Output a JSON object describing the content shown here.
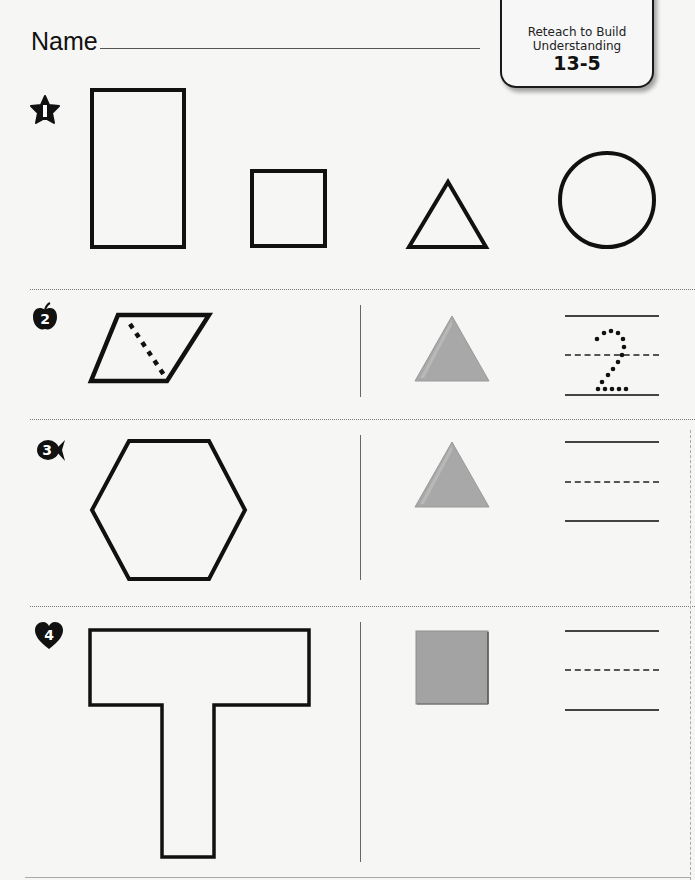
{
  "header": {
    "name_label": "Name",
    "lesson_box": {
      "subtitle_line1": "Reteach to Build",
      "subtitle_line2": "Understanding",
      "lesson_number": "13-5"
    }
  },
  "colors": {
    "page_background": "#f6f6f5",
    "outline": "#111111",
    "pattern_block_fill": "#a8a8a8",
    "lesson_box_border": "#1a1a1a"
  },
  "problems": [
    {
      "number": "1",
      "badge_icon": "star-icon",
      "shapes": [
        "rectangle",
        "square",
        "triangle",
        "circle"
      ]
    },
    {
      "number": "2",
      "badge_icon": "apple-icon",
      "outline_shape": "parallelogram",
      "dashed_divider": true,
      "pattern_block": "triangle",
      "traced_answer": "2"
    },
    {
      "number": "3",
      "badge_icon": "fish-icon",
      "outline_shape": "hexagon",
      "pattern_block": "triangle",
      "traced_answer": ""
    },
    {
      "number": "4",
      "badge_icon": "heart-icon",
      "outline_shape": "t-shape",
      "pattern_block": "square",
      "traced_answer": ""
    }
  ]
}
